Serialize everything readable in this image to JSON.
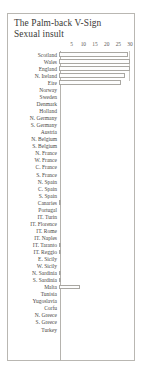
{
  "figure": {
    "title_line1": "The Palm-back V-Sign",
    "title_line2": "Sexual insult"
  },
  "chart_data": {
    "type": "bar",
    "orientation": "horizontal",
    "title": "The Palm-back V-Sign Sexual insult",
    "xlabel": "",
    "ylabel": "",
    "xlim": [
      0,
      30
    ],
    "ticks": [
      5,
      10,
      15,
      20,
      25,
      30
    ],
    "tick_labels": [
      "5",
      "10",
      "15",
      "20",
      "25",
      "30"
    ],
    "grid": false,
    "legend": "none",
    "axis_position": "top",
    "categories": [
      "Scotland",
      "Wales",
      "England",
      "N. Ireland",
      "Eire",
      "Norway",
      "Sweden",
      "Denmark",
      "Holland",
      "N. Germany",
      "S. Germany",
      "Austria",
      "N. Belgium",
      "S. Belgium",
      "N. France",
      "W. France",
      "C. France",
      "S. France",
      "N. Spain",
      "C. Spain",
      "S. Spain",
      "Canaries",
      "Portugal",
      "IT. Turin",
      "IT. Florence",
      "IT. Rome",
      "IT. Naples",
      "IT. Taranto",
      "IT. Reggio",
      "E. Sicily",
      "W. Sicily",
      "N. Sardinia",
      "S. Sardinia",
      "Malta",
      "Tunisia",
      "Yugoslavia",
      "Corfu",
      "N. Greece",
      "S. Greece",
      "Turkey"
    ],
    "values": [
      29,
      30,
      30,
      28,
      26,
      0,
      0,
      0,
      0,
      0,
      0,
      0,
      0,
      0,
      0,
      0,
      0,
      0,
      0,
      0,
      0,
      1,
      0,
      0,
      0,
      0,
      0,
      1,
      1,
      0,
      0,
      1,
      1,
      9,
      0,
      0,
      0,
      0,
      0,
      0
    ]
  }
}
